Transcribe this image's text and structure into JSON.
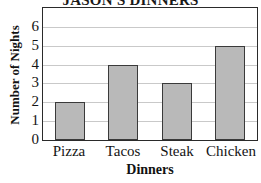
{
  "chart_data": {
    "type": "bar",
    "title": "JASON'S DINNERS",
    "xlabel": "Dinners",
    "ylabel": "Number of Nights",
    "categories": [
      "Pizza",
      "Tacos",
      "Steak",
      "Chicken"
    ],
    "values": [
      2,
      4,
      3,
      5
    ],
    "ylim": [
      0,
      7
    ],
    "yticks": [
      0,
      1,
      2,
      3,
      4,
      5,
      6
    ],
    "ytick_labels": [
      "0",
      "1",
      "2",
      "3",
      "4",
      "5",
      "6"
    ],
    "grid": true,
    "grid_axis": "y",
    "legend": false,
    "legend_position": "none",
    "bar_fill_color": "#b9b9b9",
    "bar_edge_color": "#3a3a3a",
    "gridline_color": "#c9c9c9",
    "axes_color": "#2a2a2a",
    "background_color": "#ffffff",
    "title_clipped_top": true
  }
}
